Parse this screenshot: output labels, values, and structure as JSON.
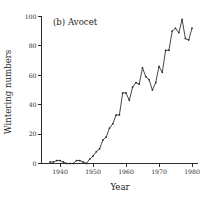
{
  "chart_data": {
    "type": "line",
    "title": "(b) Avocet",
    "xlabel": "Year",
    "ylabel": "Wintering numbers",
    "xlim": [
      1936,
      1981
    ],
    "ylim": [
      0,
      100
    ],
    "xticks": [
      1940,
      1950,
      1960,
      1970,
      1980
    ],
    "xticklabels": [
      "1940",
      "1950",
      "1960",
      "1970",
      "1980"
    ],
    "yticks": [
      0,
      20,
      40,
      60,
      80,
      100
    ],
    "yticklabels": [
      "0",
      "20",
      "40",
      "60",
      "80",
      "100"
    ],
    "grid": false,
    "legend": null,
    "marker": "square",
    "line_color": "#262626",
    "x": [
      1937,
      1938,
      1939,
      1940,
      1941,
      1942,
      1943,
      1944,
      1945,
      1946,
      1947,
      1948,
      1949,
      1950,
      1951,
      1952,
      1953,
      1954,
      1955,
      1956,
      1957,
      1958,
      1959,
      1960,
      1961,
      1962,
      1963,
      1964,
      1965,
      1966,
      1967,
      1968,
      1969,
      1970,
      1971,
      1972,
      1973,
      1974,
      1975,
      1976,
      1977,
      1978,
      1979,
      1980
    ],
    "values": [
      1,
      1,
      2,
      2,
      1,
      0,
      0,
      0,
      2,
      2,
      1,
      0,
      3,
      5,
      8,
      10,
      16,
      18,
      24,
      27,
      33,
      33,
      48,
      48,
      43,
      52,
      55,
      54,
      65,
      59,
      57,
      50,
      55,
      66,
      62,
      77,
      77,
      90,
      92,
      89,
      98,
      85,
      84,
      92
    ]
  },
  "axes": {
    "y_label": "Wintering numbers",
    "x_label": "Year"
  }
}
